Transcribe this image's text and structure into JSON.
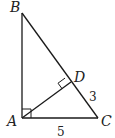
{
  "figure": {
    "type": "right-triangle-with-altitude",
    "points": {
      "A": "A",
      "B": "B",
      "C": "C",
      "D": "D"
    },
    "segments": [
      "AB",
      "AC",
      "BC",
      "AD"
    ],
    "right_angles": [
      "BAC",
      "ADB"
    ],
    "measurements": {
      "DC": "3",
      "AC": "5"
    },
    "colors": {
      "stroke": "#1a1a1a",
      "background": "#ffffff"
    }
  }
}
